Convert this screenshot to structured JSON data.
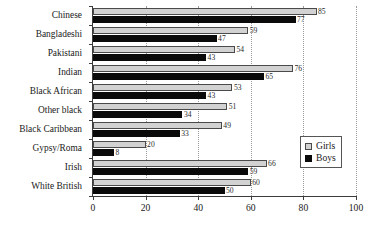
{
  "chart_data": {
    "type": "bar",
    "orientation": "horizontal",
    "title": "",
    "subtitle": "",
    "xlabel": "",
    "ylabel": "",
    "xlim": [
      0,
      100
    ],
    "xticks": [
      0,
      20,
      40,
      60,
      80,
      100
    ],
    "xtick_labels": [
      "0",
      "20",
      "40",
      "60",
      "80",
      "100"
    ],
    "grid": "vertical-dotted",
    "legend_position": "right-middle",
    "categories": [
      "Chinese",
      "Bangladeshi",
      "Pakistani",
      "Indian",
      "Black African",
      "Other black",
      "Black Caribbean",
      "Gypsy/Roma",
      "Irish",
      "White British"
    ],
    "series": [
      {
        "name": "Girls",
        "color": "#d2d2d2",
        "values": [
          85,
          59,
          54,
          76,
          53,
          51,
          49,
          20,
          66,
          60
        ]
      },
      {
        "name": "Boys",
        "color": "#0a0a0a",
        "values": [
          77,
          47,
          43,
          65,
          43,
          34,
          33,
          8,
          59,
          50
        ]
      }
    ],
    "legend": [
      {
        "label": "Girls",
        "swatch": "girls"
      },
      {
        "label": "Boys",
        "swatch": "boys"
      }
    ]
  }
}
